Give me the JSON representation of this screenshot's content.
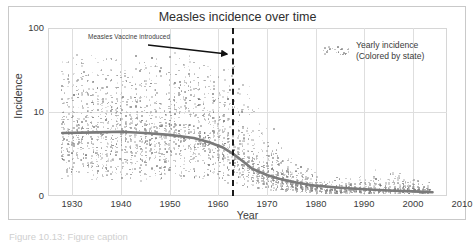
{
  "chart_data": {
    "type": "scatter",
    "title": "Measles incidence over time",
    "xlabel": "Year",
    "ylabel": "Incidence",
    "xlim": [
      1928,
      2010
    ],
    "ylim": [
      0,
      100
    ],
    "yscale": "log-like",
    "grid": true,
    "legend_position": "upper-right",
    "xticks": [
      1930,
      1940,
      1950,
      1960,
      1970,
      1980,
      1990,
      2000,
      2010
    ],
    "yticks": [
      0,
      10,
      100
    ],
    "xtick_labels": [
      "1930",
      "1940",
      "1950",
      "1960",
      "1970",
      "1980",
      "1990",
      "2000",
      "2010"
    ],
    "ytick_labels": [
      "0",
      "10",
      "100"
    ],
    "series": [
      {
        "name": "Yearly incidence (Colored by state)",
        "type": "scatter",
        "marker": "dot",
        "note": "One point per US state per year; grayscale rendering"
      },
      {
        "name": "Smoothed trend",
        "type": "line",
        "color": "#7a7a7a",
        "x": [
          1928,
          1935,
          1940,
          1945,
          1950,
          1955,
          1958,
          1961,
          1963,
          1965,
          1967,
          1970,
          1973,
          1976,
          1980,
          1985,
          1990,
          1995,
          2000,
          2004
        ],
        "values": [
          6.2,
          6.3,
          6.4,
          6.2,
          5.9,
          5.4,
          4.8,
          4.0,
          3.2,
          2.3,
          1.5,
          0.95,
          0.62,
          0.42,
          0.25,
          0.16,
          0.1,
          0.06,
          0.04,
          0.02
        ]
      }
    ],
    "annotations": [
      {
        "name": "vaccine-introduced",
        "text": "Measles Vaccine introduced",
        "x": 1963,
        "marker": "dashed-vertical-line",
        "marker_color": "#1a1a1a",
        "arrow": true
      }
    ],
    "legend": {
      "swatch": "scatter-dots",
      "line1": "Yearly incidence",
      "line2": "(Colored by state)"
    }
  },
  "title": {
    "text": "Measles incidence over time"
  },
  "axes": {
    "y": {
      "label": "Incidence",
      "ticks": [
        {
          "value": 100,
          "label": "100"
        },
        {
          "value": 10,
          "label": "10"
        },
        {
          "value": 0,
          "label": "0"
        }
      ]
    },
    "x": {
      "label": "Year",
      "ticks": [
        {
          "value": 1930,
          "label": "1930"
        },
        {
          "value": 1940,
          "label": "1940"
        },
        {
          "value": 1950,
          "label": "1950"
        },
        {
          "value": 1960,
          "label": "1960"
        },
        {
          "value": 1970,
          "label": "1970"
        },
        {
          "value": 1980,
          "label": "1980"
        },
        {
          "value": 1990,
          "label": "1990"
        },
        {
          "value": 2000,
          "label": "2000"
        },
        {
          "value": 2010,
          "label": "2010"
        }
      ]
    }
  },
  "annotation": {
    "vaccine_text": "Measles Vaccine introduced"
  },
  "legend": {
    "line1": "Yearly incidence",
    "line2": "(Colored by state)"
  },
  "caption": {
    "text": "Figure 10.13: Figure caption"
  },
  "colors": {
    "trend_line": "#7a7a7a",
    "vaccine_line": "#1a1a1a",
    "grid": "#dedede",
    "frame": "#d6d6d6",
    "text": "#3a3a3a"
  }
}
